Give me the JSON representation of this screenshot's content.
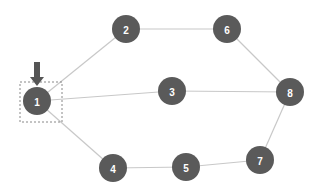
{
  "graph": {
    "nodes": [
      {
        "id": "1",
        "label": "1",
        "x": 37,
        "y": 101
      },
      {
        "id": "2",
        "label": "2",
        "x": 126,
        "y": 29
      },
      {
        "id": "3",
        "label": "3",
        "x": 172,
        "y": 91
      },
      {
        "id": "4",
        "label": "4",
        "x": 113,
        "y": 168
      },
      {
        "id": "5",
        "label": "5",
        "x": 186,
        "y": 167
      },
      {
        "id": "6",
        "label": "6",
        "x": 227,
        "y": 29
      },
      {
        "id": "7",
        "label": "7",
        "x": 260,
        "y": 160
      },
      {
        "id": "8",
        "label": "8",
        "x": 290,
        "y": 92
      }
    ],
    "edges": [
      [
        "1",
        "2"
      ],
      [
        "1",
        "3"
      ],
      [
        "1",
        "4"
      ],
      [
        "2",
        "6"
      ],
      [
        "6",
        "8"
      ],
      [
        "3",
        "8"
      ],
      [
        "4",
        "5"
      ],
      [
        "5",
        "7"
      ],
      [
        "7",
        "8"
      ]
    ],
    "selected_node": "1",
    "colors": {
      "node": "#5a5a5a",
      "edge": "#c8c8c8",
      "arrow": "#555555",
      "selection": "#888888"
    }
  }
}
